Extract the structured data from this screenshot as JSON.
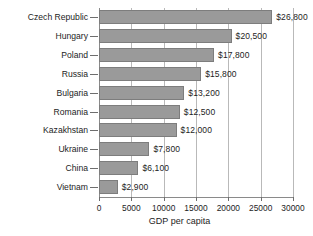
{
  "chart_data": {
    "type": "bar",
    "orientation": "horizontal",
    "title": "",
    "xlabel": "GDP per capita",
    "ylabel": "",
    "xlim": [
      0,
      30000
    ],
    "xticks": [
      0,
      5000,
      10000,
      15000,
      20000,
      25000,
      30000
    ],
    "xtick_labels": [
      "0",
      "5000",
      "10000",
      "15000",
      "20000",
      "25000",
      "30000"
    ],
    "grid": "vertical",
    "legend": "none",
    "bar_color": "#9a9a9a",
    "bar_edge_color": "#7d7d7d",
    "grid_color": "#b9b9b9",
    "axis_color": "#8a8a8a",
    "categories": [
      "Czech Republic",
      "Hungary",
      "Poland",
      "Russia",
      "Bulgaria",
      "Romania",
      "Kazakhstan",
      "Ukraine",
      "China",
      "Vietnam"
    ],
    "values": [
      26800,
      20500,
      17800,
      15800,
      13200,
      12500,
      12000,
      7800,
      6100,
      2900
    ],
    "value_labels": [
      "$26,800",
      "$20,500",
      "$17,800",
      "$15,800",
      "$13,200",
      "$12,500",
      "$12,000",
      "$7,800",
      "$6,100",
      "$2,900"
    ]
  }
}
